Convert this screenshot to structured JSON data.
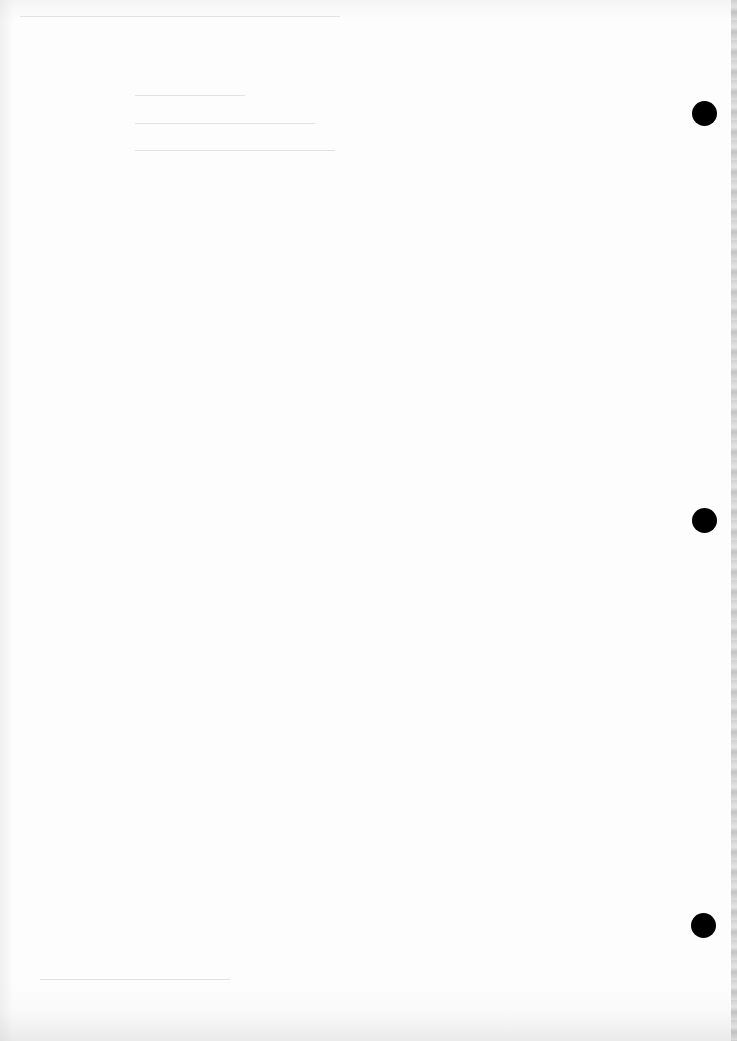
{
  "document": {
    "type": "blank scanned page",
    "visible_text": "",
    "punch_holes": [
      {
        "name": "top",
        "cx": 704,
        "cy": 113
      },
      {
        "name": "middle",
        "cx": 704,
        "cy": 520
      },
      {
        "name": "bottom",
        "cx": 703,
        "cy": 925
      }
    ],
    "colors": {
      "paper": "#fdfdfd",
      "hole": "#000000",
      "edge_shadow": "#c9c9c9"
    }
  }
}
